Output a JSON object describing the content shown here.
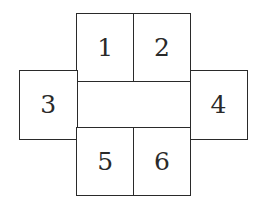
{
  "diagram": {
    "faces": [
      {
        "id": "1",
        "label": "1"
      },
      {
        "id": "2",
        "label": "2"
      },
      {
        "id": "3",
        "label": "3"
      },
      {
        "id": "4",
        "label": "4"
      },
      {
        "id": "5",
        "label": "5"
      },
      {
        "id": "6",
        "label": "6"
      }
    ],
    "center_band_label": ""
  },
  "colors": {
    "stroke": "#2a2a2a",
    "fill": "#ffffff"
  }
}
